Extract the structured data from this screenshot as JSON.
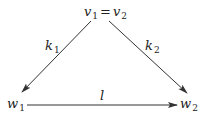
{
  "diagram": {
    "type": "commutative-triangle",
    "nodes": {
      "top": {
        "base1": "v",
        "sub1": "1",
        "eq": "=",
        "base2": "v",
        "sub2": "2"
      },
      "left": {
        "base": "w",
        "sub": "1"
      },
      "right": {
        "base": "w",
        "sub": "2"
      }
    },
    "edges": {
      "left": {
        "base": "k",
        "sub": "1",
        "from": "top",
        "to": "left"
      },
      "right": {
        "base": "k",
        "sub": "2",
        "from": "top",
        "to": "right"
      },
      "bottom": {
        "base": "l",
        "from": "left",
        "to": "right"
      }
    },
    "colors": {
      "stroke": "#333333",
      "text": "#222222",
      "background": "#ffffff"
    }
  }
}
